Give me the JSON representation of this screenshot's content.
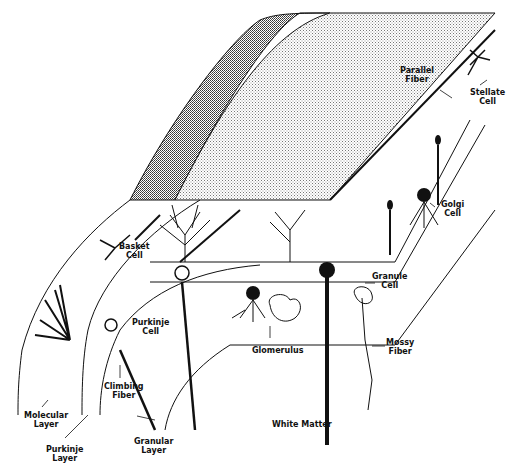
{
  "diagram": {
    "type": "anatomical-illustration",
    "colors": {
      "ink": "#111111",
      "background": "#ffffff",
      "stipple_light": "#9a9a9a",
      "stipple_dark": "#444444"
    },
    "labels": {
      "parallel_fiber": "Parallel\nFiber",
      "stellate_cell": "Stellate\nCell",
      "basket_cell": "Basket\nCell",
      "golgi_cell": "Golgi\nCell",
      "granule_cell": "Granule\nCell",
      "purkinje_cell": "Purkinje\nCell",
      "glomerulus": "Glomerulus",
      "mossy_fiber": "Mossy\nFiber",
      "climbing_fiber": "Climbing\nFiber",
      "molecular_layer": "Molecular\nLayer",
      "purkinje_layer": "Purkinje\nLayer",
      "granular_layer": "Granular\nLayer",
      "white_matter": "White Matter"
    }
  }
}
